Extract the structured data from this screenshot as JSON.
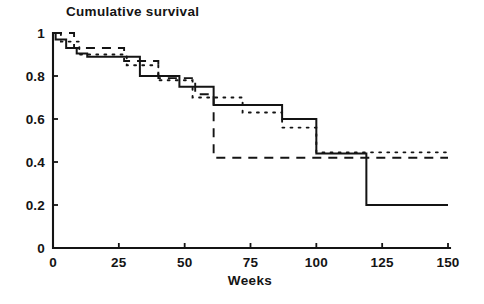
{
  "chart_data": {
    "type": "line",
    "subtype": "kaplan-meier-step",
    "title": "Cumulative survival",
    "xlabel": "Weeks",
    "ylabel": "",
    "xlim": [
      0,
      150
    ],
    "ylim": [
      0,
      1
    ],
    "grid": false,
    "legend": "none",
    "x_ticks": [
      0,
      25,
      50,
      75,
      100,
      125,
      150
    ],
    "x_tick_labels": [
      "0",
      "25",
      "50",
      "75",
      "100",
      "125",
      "150"
    ],
    "y_ticks": [
      0,
      0.2,
      0.4,
      0.6,
      0.8,
      1
    ],
    "y_tick_labels": [
      "0",
      "0.2",
      "0.4",
      "0.6",
      "0.8",
      "1"
    ],
    "series": [
      {
        "name": "group-solid",
        "style": "solid",
        "color": "#141414",
        "points": [
          [
            0,
            1.0
          ],
          [
            1,
            0.97
          ],
          [
            5,
            0.93
          ],
          [
            9,
            0.905
          ],
          [
            13,
            0.89
          ],
          [
            33,
            0.8
          ],
          [
            48,
            0.75
          ],
          [
            61,
            0.665
          ],
          [
            87,
            0.6
          ],
          [
            100,
            0.44
          ],
          [
            119,
            0.2
          ],
          [
            150,
            0.2
          ]
        ]
      },
      {
        "name": "group-dashed",
        "style": "dashed",
        "color": "#141414",
        "points": [
          [
            0,
            1.0
          ],
          [
            8,
            0.93
          ],
          [
            27,
            0.87
          ],
          [
            40,
            0.79
          ],
          [
            54,
            0.715
          ],
          [
            61,
            0.42
          ],
          [
            150,
            0.42
          ]
        ]
      },
      {
        "name": "group-dotted",
        "style": "dotted",
        "color": "#141414",
        "points": [
          [
            0,
            1.0
          ],
          [
            3,
            0.96
          ],
          [
            10,
            0.9
          ],
          [
            28,
            0.85
          ],
          [
            40,
            0.78
          ],
          [
            53,
            0.7
          ],
          [
            72,
            0.63
          ],
          [
            87,
            0.56
          ],
          [
            100,
            0.445
          ],
          [
            150,
            0.445
          ]
        ]
      }
    ]
  },
  "axes": {
    "x_axis_name": "Weeks",
    "y_axis_name": "Cumulative survival"
  }
}
